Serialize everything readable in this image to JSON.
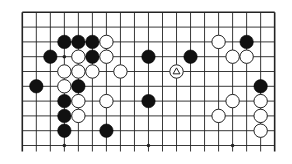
{
  "diagram": {
    "type": "go-board-fragment",
    "columns": 19,
    "rows_visible": 10,
    "edges": {
      "top": true,
      "left": true,
      "right": true,
      "bottom": false
    },
    "colors": {
      "line": "#222222",
      "black_stone": "#111111",
      "white_stone": "#ffffff",
      "background": "#ffffff"
    },
    "hoshi": [
      [
        3,
        3
      ],
      [
        9,
        3
      ],
      [
        15,
        3
      ],
      [
        3,
        9
      ],
      [
        9,
        9
      ],
      [
        15,
        9
      ]
    ],
    "stones": {
      "black": [
        [
          3,
          2
        ],
        [
          4,
          2
        ],
        [
          5,
          2
        ],
        [
          16,
          2
        ],
        [
          2,
          3
        ],
        [
          5,
          3
        ],
        [
          9,
          3
        ],
        [
          12,
          3
        ],
        [
          1,
          5
        ],
        [
          4,
          5
        ],
        [
          17,
          5
        ],
        [
          3,
          6
        ],
        [
          9,
          6
        ],
        [
          3,
          7
        ],
        [
          3,
          8
        ],
        [
          6,
          8
        ]
      ],
      "white": [
        [
          6,
          2
        ],
        [
          14,
          2
        ],
        [
          4,
          3
        ],
        [
          6,
          3
        ],
        [
          15,
          3
        ],
        [
          16,
          3
        ],
        [
          3,
          4
        ],
        [
          4,
          4
        ],
        [
          5,
          4
        ],
        [
          7,
          4
        ],
        [
          11,
          4
        ],
        [
          3,
          5
        ],
        [
          4,
          6
        ],
        [
          6,
          6
        ],
        [
          15,
          6
        ],
        [
          17,
          6
        ],
        [
          4,
          7
        ],
        [
          14,
          7
        ],
        [
          17,
          7
        ],
        [
          17,
          8
        ]
      ]
    },
    "markers": [
      {
        "col": 11,
        "row": 4,
        "shape": "triangle",
        "on": "white"
      }
    ]
  }
}
